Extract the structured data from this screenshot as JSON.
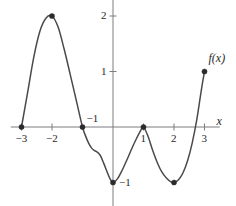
{
  "chart_data": {
    "type": "line",
    "title": "",
    "subtitle": "",
    "xlabel": "x",
    "ylabel": "",
    "curve_label": "f(x)",
    "xlim": [
      -3.35,
      3.5
    ],
    "ylim": [
      -1.45,
      2.35
    ],
    "grid": false,
    "legend": "none",
    "x_ticks": [
      -3,
      -2,
      1,
      2,
      3
    ],
    "x_tick_labels": [
      "−3",
      "−2",
      "1",
      "2",
      "3"
    ],
    "y_ticks": [
      1,
      2
    ],
    "y_tick_labels": [
      "1",
      "2"
    ],
    "extra_labels": [
      {
        "text": "−1",
        "x": -1,
        "y": 0,
        "note": "label for x = -1 zero crossing"
      },
      {
        "text": "−1",
        "x": 0,
        "y": -1,
        "note": "label for minimum at (0,-1)"
      }
    ],
    "marked_points": [
      {
        "x": -3,
        "y": 0,
        "label": "−3"
      },
      {
        "x": -2,
        "y": 2,
        "label": ""
      },
      {
        "x": -1,
        "y": 0,
        "label": "−1"
      },
      {
        "x": 0,
        "y": -1,
        "label": "−1"
      },
      {
        "x": 1,
        "y": 0,
        "label": "1"
      },
      {
        "x": 2,
        "y": -1,
        "label": ""
      },
      {
        "x": 3,
        "y": 1,
        "label": ""
      }
    ],
    "series": [
      {
        "name": "f(x)",
        "x": [
          -3.0,
          -2.8,
          -2.6,
          -2.4,
          -2.2,
          -2.0,
          -1.8,
          -1.6,
          -1.4,
          -1.2,
          -1.0,
          -0.9,
          -0.8,
          -0.7,
          -0.62,
          -0.55,
          -0.48,
          -0.4,
          -0.3,
          -0.2,
          -0.1,
          0.0,
          0.15,
          0.3,
          0.45,
          0.6,
          0.75,
          0.9,
          1.0,
          1.15,
          1.3,
          1.45,
          1.6,
          1.75,
          1.9,
          2.0,
          2.15,
          2.3,
          2.45,
          2.6,
          2.75,
          2.9,
          3.0
        ],
        "y": [
          0.0,
          0.62,
          1.25,
          1.72,
          1.96,
          2.0,
          1.8,
          1.4,
          0.94,
          0.47,
          0.0,
          -0.16,
          -0.29,
          -0.38,
          -0.42,
          -0.44,
          -0.47,
          -0.53,
          -0.66,
          -0.8,
          -0.93,
          -1.0,
          -0.93,
          -0.78,
          -0.6,
          -0.41,
          -0.23,
          -0.07,
          0.0,
          -0.17,
          -0.42,
          -0.64,
          -0.81,
          -0.92,
          -0.99,
          -1.0,
          -0.95,
          -0.82,
          -0.6,
          -0.28,
          0.14,
          0.68,
          1.0
        ]
      }
    ]
  },
  "axes": {
    "x_axis_name": "x-axis",
    "y_axis_name": "y-axis"
  }
}
